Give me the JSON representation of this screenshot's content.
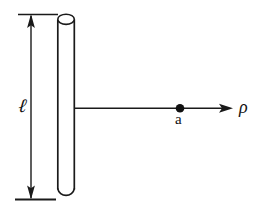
{
  "figure": {
    "kind": "physics-geometry-diagram",
    "caption": "",
    "background_color": "#ffffff",
    "stroke_color": "#1a1a1a",
    "width": 262,
    "height": 215,
    "labels": {
      "length": "ℓ",
      "point": "a",
      "distance": "ρ"
    },
    "elements": {
      "rod": {
        "name": "vertical cylindrical rod",
        "left_x": 57,
        "right_x": 75,
        "top_y": 19,
        "bottom_y": 196,
        "cap_ellipse_ry": 5
      },
      "dimension": {
        "name": "length dimension with double arrow",
        "axis_x": 31,
        "top_y": 14,
        "bottom_y": 199,
        "extension_top": {
          "x1": 18,
          "x2": 58,
          "y": 14
        },
        "extension_bottom": {
          "x1": 15,
          "x2": 56,
          "y": 199
        }
      },
      "radial_axis": {
        "name": "horizontal distance arrow",
        "y": 108,
        "start_x": 75,
        "tip_x": 233
      },
      "field_point": {
        "name": "field point marker",
        "x": 180,
        "y": 108,
        "radius": 4.2
      }
    }
  }
}
